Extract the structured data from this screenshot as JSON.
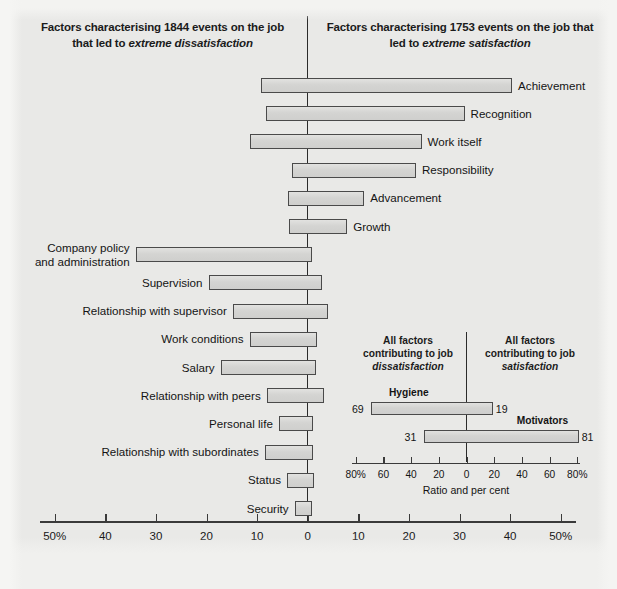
{
  "figure": {
    "title_left": "Factors characterising 1844 events on the job that led to extreme dissatisfaction",
    "title_left_plain": "Factors characterising 1844 events on the job that led to ",
    "title_left_italic": "extreme dissatisfaction",
    "title_right_plain": "Factors characterising 1753 events on the job that led to ",
    "title_right_italic": "extreme satisfaction",
    "axis_caption": "Percentage frequency"
  },
  "chart_data": {
    "type": "bar",
    "orientation": "horizontal",
    "subtype": "diverging-tornado",
    "xlabel": "Percentage frequency",
    "ylabel": "",
    "xlim": [
      -50,
      50
    ],
    "xticks": [
      -50,
      -40,
      -30,
      -20,
      -10,
      0,
      10,
      20,
      30,
      40,
      50
    ],
    "xticklabels": [
      "50%",
      "40",
      "30",
      "20",
      "10",
      "0",
      "10",
      "20",
      "30",
      "40",
      "50%"
    ],
    "grid": false,
    "legend": "none",
    "left_heading": "Factors characterising 1844 events on the job that led to extreme dissatisfaction",
    "right_heading": "Factors characterising 1753 events on the job that led to extreme satisfaction",
    "note": "Each bar spans from its dissatisfaction percentage (left of zero) to its satisfaction percentage (right of zero).",
    "categories": [
      "Achievement",
      "Recognition",
      "Work itself",
      "Responsibility",
      "Advancement",
      "Growth",
      "Company policy and administration",
      "Supervision",
      "Relationship with supervisor",
      "Work conditions",
      "Salary",
      "Relationship with peers",
      "Personal life",
      "Relationship with subordinates",
      "Status",
      "Security"
    ],
    "series": [
      {
        "name": "Dissatisfaction (left of zero, %)",
        "values": [
          9.3,
          8.3,
          11.5,
          3.2,
          4.0,
          3.8,
          34.0,
          19.6,
          14.8,
          11.5,
          17.2,
          8.1,
          5.7,
          8.5,
          4.1,
          2.6
        ]
      },
      {
        "name": "Satisfaction (right of zero, %)",
        "values": [
          40.4,
          31.0,
          22.5,
          21.4,
          11.2,
          7.8,
          0.9,
          2.8,
          4.0,
          1.8,
          1.6,
          3.2,
          1.0,
          1.0,
          1.2,
          0.8
        ]
      }
    ],
    "bars": [
      {
        "label": "Achievement",
        "side": "right",
        "dissatisfaction": 9.3,
        "satisfaction": 40.4
      },
      {
        "label": "Recognition",
        "side": "right",
        "dissatisfaction": 8.3,
        "satisfaction": 31.0
      },
      {
        "label": "Work itself",
        "side": "right",
        "dissatisfaction": 11.5,
        "satisfaction": 22.5
      },
      {
        "label": "Responsibility",
        "side": "right",
        "dissatisfaction": 3.2,
        "satisfaction": 21.4
      },
      {
        "label": "Advancement",
        "side": "right",
        "dissatisfaction": 4.0,
        "satisfaction": 11.2
      },
      {
        "label": "Growth",
        "side": "right",
        "dissatisfaction": 3.8,
        "satisfaction": 7.8
      },
      {
        "label": "Company policy\nand administration",
        "side": "left",
        "dissatisfaction": 34.0,
        "satisfaction": 0.9
      },
      {
        "label": "Supervision",
        "side": "left",
        "dissatisfaction": 19.6,
        "satisfaction": 2.8
      },
      {
        "label": "Relationship with supervisor",
        "side": "left",
        "dissatisfaction": 14.8,
        "satisfaction": 4.0
      },
      {
        "label": "Work conditions",
        "side": "left",
        "dissatisfaction": 11.5,
        "satisfaction": 1.8
      },
      {
        "label": "Salary",
        "side": "left",
        "dissatisfaction": 17.2,
        "satisfaction": 1.6
      },
      {
        "label": "Relationship with peers",
        "side": "left",
        "dissatisfaction": 8.1,
        "satisfaction": 3.2
      },
      {
        "label": "Personal life",
        "side": "left",
        "dissatisfaction": 5.7,
        "satisfaction": 1.0
      },
      {
        "label": "Relationship with subordinates",
        "side": "left",
        "dissatisfaction": 8.5,
        "satisfaction": 1.0
      },
      {
        "label": "Status",
        "side": "left",
        "dissatisfaction": 4.1,
        "satisfaction": 1.2
      },
      {
        "label": "Security",
        "side": "left",
        "dissatisfaction": 2.6,
        "satisfaction": 0.8
      }
    ]
  },
  "inset_chart_data": {
    "type": "bar",
    "orientation": "horizontal",
    "subtype": "diverging-tornado",
    "title_left_plain": "All factors contributing to job ",
    "title_left_italic": "dissatisfaction",
    "title_right_plain": "All factors contributing to job ",
    "title_right_italic": "satisfaction",
    "xlabel": "Ratio and per cent",
    "xlim": [
      -80,
      80
    ],
    "xticks": [
      -80,
      -60,
      -40,
      -20,
      0,
      20,
      40,
      60,
      80
    ],
    "xticklabels": [
      "80%",
      "60",
      "40",
      "20",
      "0",
      "20",
      "40",
      "60",
      "80%"
    ],
    "categories": [
      "Hygiene",
      "Motivators"
    ],
    "series": [
      {
        "name": "Dissatisfaction (left, %)",
        "values": [
          69,
          31
        ]
      },
      {
        "name": "Satisfaction (right, %)",
        "values": [
          19,
          81
        ]
      }
    ],
    "bars": [
      {
        "label": "Hygiene",
        "left_value": "69",
        "right_value": "19"
      },
      {
        "label": "Motivators",
        "left_value": "31",
        "right_value": "81"
      }
    ]
  },
  "labels": {
    "b0": "Achievement",
    "b1": "Recognition",
    "b2": "Work itself",
    "b3": "Responsibility",
    "b4": "Advancement",
    "b5": "Growth",
    "b6a": "Company policy",
    "b6b": "and administration",
    "b7": "Supervision",
    "b8": "Relationship with supervisor",
    "b9": "Work conditions",
    "b10": "Salary",
    "b11": "Relationship with peers",
    "b12": "Personal life",
    "b13": "Relationship with subordinates",
    "b14": "Status",
    "b15": "Security"
  },
  "axis": {
    "t0": "50%",
    "t1": "40",
    "t2": "30",
    "t3": "20",
    "t4": "10",
    "t5": "0",
    "t6": "10",
    "t7": "20",
    "t8": "30",
    "t9": "40",
    "t10": "50%",
    "caption": "Percentage frequency"
  },
  "inset_axis": {
    "t0": "80%",
    "t1": "60",
    "t2": "40",
    "t3": "20",
    "t4": "0",
    "t5": "20",
    "t6": "40",
    "t7": "60",
    "t8": "80%",
    "caption": "Ratio and per cent"
  },
  "inset_labels": {
    "hygiene": "Hygiene",
    "motivators": "Motivators",
    "hygiene_left": "69",
    "hygiene_right": "19",
    "motivators_left": "31",
    "motivators_right": "81"
  },
  "colors": {
    "background": "#e9e9e7",
    "bar_fill": "#d6d6d4",
    "bar_stroke": "#4a4a4a",
    "axis": "#3a3a3a",
    "text": "#141414"
  }
}
